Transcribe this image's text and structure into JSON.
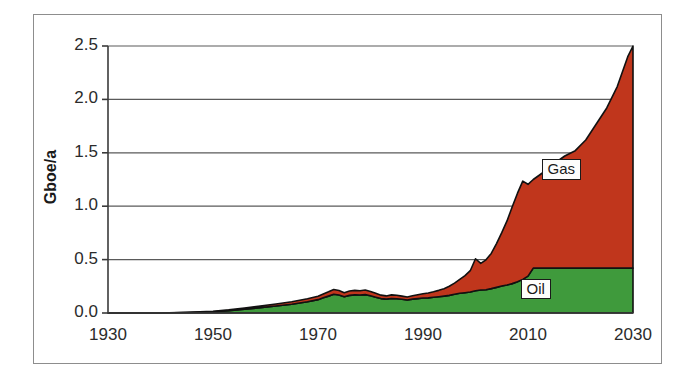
{
  "chart_data": {
    "type": "area",
    "stacked": true,
    "title": "",
    "subtitle": "",
    "xlabel": "",
    "ylabel": "Gboe/a",
    "xlim": [
      1930,
      2030
    ],
    "ylim": [
      0.0,
      2.5
    ],
    "xticks": [
      1930,
      1950,
      1970,
      1990,
      2010,
      2030
    ],
    "xtick_labels": [
      "1930",
      "1950",
      "1970",
      "1990",
      "2010",
      "2030"
    ],
    "yticks": [
      0.0,
      0.5,
      1.0,
      1.5,
      2.0,
      2.5
    ],
    "ytick_labels": [
      "0.0",
      "0.5",
      "1.0",
      "1.5",
      "2.0",
      "2.5"
    ],
    "grid": "horizontal",
    "legend_position": "inline-labels",
    "colors": {
      "oil": "#3f9a3c",
      "gas": "#c0361c",
      "outline": "#111111",
      "gridline": "#5a5a5a",
      "frame": "#8d8d8d",
      "background": "#ffffff"
    },
    "x": [
      1930,
      1935,
      1940,
      1945,
      1950,
      1953,
      1956,
      1959,
      1962,
      1965,
      1968,
      1970,
      1971,
      1972,
      1973,
      1974,
      1975,
      1976,
      1977,
      1978,
      1979,
      1980,
      1981,
      1982,
      1983,
      1984,
      1985,
      1986,
      1987,
      1988,
      1989,
      1990,
      1991,
      1992,
      1993,
      1994,
      1995,
      1996,
      1997,
      1998,
      1999,
      2000,
      2001,
      2002,
      2003,
      2004,
      2005,
      2006,
      2007,
      2008,
      2009,
      2010,
      2011,
      2013,
      2015,
      2017,
      2019,
      2021,
      2023,
      2025,
      2027,
      2029,
      2030
    ],
    "series": [
      {
        "name": "Oil",
        "label": "Oil",
        "color": "#3f9a3c",
        "values": [
          0.0,
          0.0,
          0.0,
          0.005,
          0.012,
          0.022,
          0.035,
          0.05,
          0.065,
          0.082,
          0.105,
          0.125,
          0.142,
          0.158,
          0.175,
          0.168,
          0.152,
          0.165,
          0.17,
          0.168,
          0.172,
          0.162,
          0.148,
          0.135,
          0.13,
          0.136,
          0.134,
          0.128,
          0.122,
          0.13,
          0.135,
          0.14,
          0.142,
          0.147,
          0.152,
          0.158,
          0.165,
          0.175,
          0.185,
          0.19,
          0.196,
          0.208,
          0.215,
          0.218,
          0.228,
          0.24,
          0.252,
          0.262,
          0.275,
          0.292,
          0.315,
          0.345,
          0.42,
          0.42,
          0.42,
          0.42,
          0.42,
          0.42,
          0.42,
          0.42,
          0.42,
          0.42,
          0.42
        ]
      },
      {
        "name": "Gas",
        "label": "Gas",
        "color": "#c0361c",
        "values": [
          0.0,
          0.0,
          0.0,
          0.002,
          0.005,
          0.008,
          0.012,
          0.016,
          0.02,
          0.024,
          0.028,
          0.032,
          0.036,
          0.04,
          0.045,
          0.042,
          0.038,
          0.041,
          0.042,
          0.04,
          0.043,
          0.04,
          0.036,
          0.032,
          0.03,
          0.034,
          0.032,
          0.03,
          0.028,
          0.032,
          0.036,
          0.04,
          0.046,
          0.052,
          0.06,
          0.07,
          0.085,
          0.105,
          0.13,
          0.16,
          0.2,
          0.3,
          0.25,
          0.28,
          0.33,
          0.41,
          0.5,
          0.6,
          0.72,
          0.83,
          0.92,
          0.86,
          0.83,
          0.9,
          0.98,
          1.05,
          1.1,
          1.2,
          1.35,
          1.5,
          1.7,
          1.98,
          2.08
        ]
      }
    ],
    "annotations": [
      {
        "text": "Gas",
        "x": 2016,
        "y": 1.33
      },
      {
        "text": "Oil",
        "x": 2012,
        "y": 0.21
      }
    ]
  },
  "axis": {
    "y_title": "Gboe/a"
  }
}
